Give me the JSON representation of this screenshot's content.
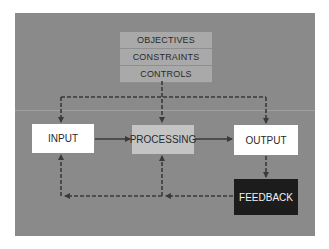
{
  "diagram": {
    "title": "",
    "control_stack": {
      "items": [
        {
          "label": "OBJECTIVES"
        },
        {
          "label": "CONSTRAINTS"
        },
        {
          "label": "CONTROLS"
        }
      ]
    },
    "nodes": {
      "input": {
        "label": "INPUT"
      },
      "processing": {
        "label": "PROCESSING"
      },
      "output": {
        "label": "OUTPUT"
      },
      "feedback": {
        "label": "FEEDBACK"
      }
    },
    "edges": [
      {
        "from": "control_stack",
        "to": "input",
        "style": "dashed"
      },
      {
        "from": "control_stack",
        "to": "processing",
        "style": "dashed"
      },
      {
        "from": "control_stack",
        "to": "output",
        "style": "dashed"
      },
      {
        "from": "input",
        "to": "processing",
        "style": "solid"
      },
      {
        "from": "processing",
        "to": "output",
        "style": "solid"
      },
      {
        "from": "output",
        "to": "feedback",
        "style": "dashed"
      },
      {
        "from": "feedback",
        "to": "processing",
        "style": "dashed"
      },
      {
        "from": "feedback",
        "to": "input",
        "style": "dashed"
      }
    ],
    "colors": {
      "background": "#8a8a8a",
      "stack": "#a9a9a9",
      "processing": "#c4c4c4",
      "input_output": "#ffffff",
      "feedback": "#1c1c1c",
      "arrow": "#3a3a3a"
    }
  }
}
